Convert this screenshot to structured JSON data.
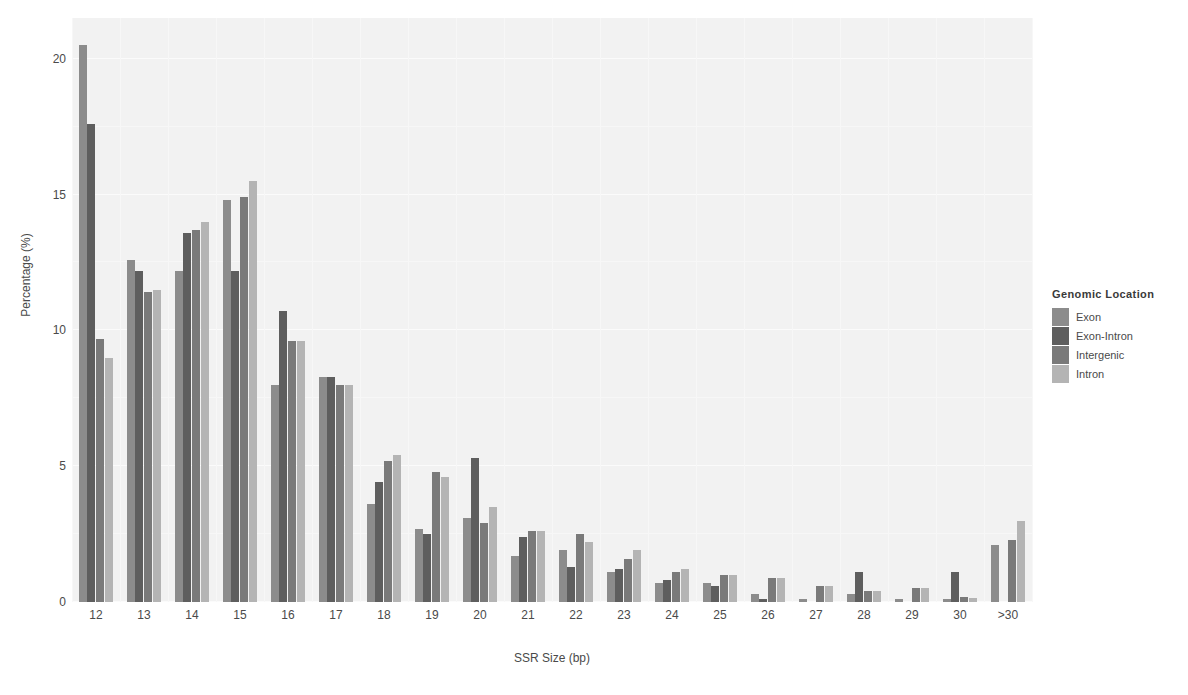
{
  "chart_data": {
    "type": "bar",
    "title": "",
    "xlabel": "SSR Size (bp)",
    "ylabel": "Percentage (%)",
    "ylim": [
      0,
      21.5
    ],
    "yticks": [
      0,
      5,
      10,
      15,
      20
    ],
    "ytick_labels": [
      "0",
      "5",
      "10",
      "15",
      "20"
    ],
    "grid": true,
    "legend_position": "right",
    "legend_title": "Genomic Location",
    "categories": [
      "12",
      "13",
      "14",
      "15",
      "16",
      "17",
      "18",
      "19",
      "20",
      "21",
      "22",
      "23",
      "24",
      "25",
      "26",
      "27",
      "28",
      "29",
      "30",
      ">30"
    ],
    "series": [
      {
        "name": "Exon",
        "color": "#8c8c8c",
        "values": [
          20.5,
          12.6,
          12.2,
          14.8,
          8.0,
          8.3,
          3.6,
          2.7,
          3.1,
          1.7,
          1.9,
          1.1,
          0.7,
          0.7,
          0.3,
          0.1,
          0.3,
          0.1,
          0.1,
          2.1
        ]
      },
      {
        "name": "Exon-Intron",
        "color": "#5e5e5e",
        "values": [
          17.6,
          12.2,
          13.6,
          12.2,
          10.7,
          8.3,
          4.4,
          2.5,
          5.3,
          2.4,
          1.3,
          1.2,
          0.8,
          0.6,
          0.1,
          0.0,
          1.1,
          0.0,
          1.1,
          0.0
        ]
      },
      {
        "name": "Intergenic",
        "color": "#7a7a7a",
        "values": [
          9.7,
          11.4,
          13.7,
          14.9,
          9.6,
          8.0,
          5.2,
          4.8,
          2.9,
          2.6,
          2.5,
          1.6,
          1.1,
          1.0,
          0.9,
          0.6,
          0.4,
          0.5,
          0.2,
          2.3
        ]
      },
      {
        "name": "Intron",
        "color": "#b4b4b4",
        "values": [
          9.0,
          11.5,
          14.0,
          15.5,
          9.6,
          8.0,
          5.4,
          4.6,
          3.5,
          2.6,
          2.2,
          1.9,
          1.2,
          1.0,
          0.9,
          0.6,
          0.4,
          0.5,
          0.15,
          3.0
        ]
      }
    ]
  },
  "legend": {
    "title": "Genomic Location",
    "items": [
      {
        "label": "Exon",
        "color": "#8c8c8c"
      },
      {
        "label": "Exon-Intron",
        "color": "#5e5e5e"
      },
      {
        "label": "Intergenic",
        "color": "#7a7a7a"
      },
      {
        "label": "Intron",
        "color": "#b4b4b4"
      }
    ]
  },
  "axes": {
    "x_title": "SSR Size (bp)",
    "y_title": "Percentage (%)"
  },
  "colors": {
    "panel_background": "#f2f2f2",
    "page_background": "#ffffff",
    "gridline": "#fbfbfb",
    "text": "#4a4a4a"
  }
}
